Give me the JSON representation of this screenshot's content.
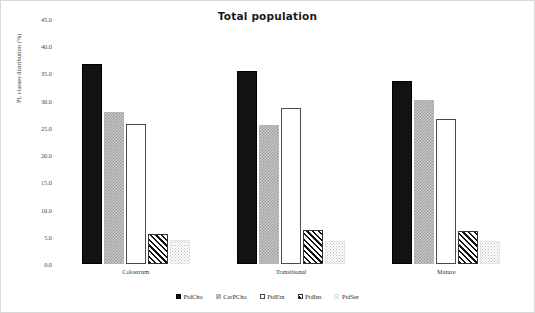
{
  "chart_data": {
    "type": "bar",
    "title": "Total population",
    "xlabel": "",
    "ylabel": "PL classes distribution (%)",
    "categories": [
      "Colostrum",
      "Transitional",
      "Mature"
    ],
    "series": [
      {
        "name": "PtdCho",
        "values": [
          36.7,
          35.5,
          33.6
        ]
      },
      {
        "name": "CerPCho",
        "values": [
          27.9,
          25.5,
          30.1
        ]
      },
      {
        "name": "PtdEtn",
        "values": [
          25.7,
          28.7,
          26.6
        ]
      },
      {
        "name": "PtdIns",
        "values": [
          5.5,
          6.2,
          6.1
        ]
      },
      {
        "name": "PtdSer",
        "values": [
          4.4,
          4.2,
          4.2
        ]
      }
    ],
    "ylim": [
      0.0,
      45.0
    ],
    "ytick_step": 5.0,
    "ytick_labels": [
      "45.0",
      "40.0",
      "35.0",
      "30.0",
      "25.0",
      "20.0",
      "15.0",
      "10.0",
      "5.0",
      "0.0"
    ],
    "ytick_values": [
      45.0,
      40.0,
      35.0,
      30.0,
      25.0,
      20.0,
      15.0,
      10.0,
      5.0,
      0.0
    ],
    "grid": false,
    "legend_position": "bottom-center",
    "legend": [
      {
        "label": "PtdCho",
        "pattern": "solid-black",
        "color": "#121212"
      },
      {
        "label": "CerPCho",
        "pattern": "gray-checker",
        "color": "#c7c7c7"
      },
      {
        "label": "PtdEtn",
        "pattern": "white-outline",
        "color": "#ffffff"
      },
      {
        "label": "PtdIns",
        "pattern": "diagonal-hatch",
        "color": "#111111"
      },
      {
        "label": "PtdSer",
        "pattern": "light-dots",
        "color": "#b9b9b9"
      }
    ]
  }
}
